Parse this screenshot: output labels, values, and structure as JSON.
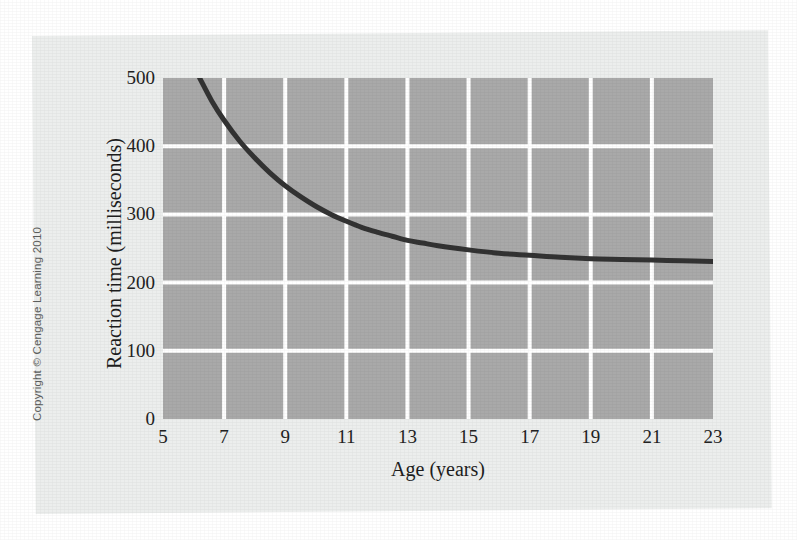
{
  "figure": {
    "copyright": "Copyright © Cengage Learning 2010"
  },
  "chart_data": {
    "type": "line",
    "title": "",
    "xlabel": "Age (years)",
    "ylabel": "Reaction time (milliseconds)",
    "xlim": [
      5,
      23
    ],
    "ylim": [
      0,
      500
    ],
    "xticks": [
      "5",
      "7",
      "9",
      "11",
      "13",
      "15",
      "17",
      "19",
      "21",
      "23"
    ],
    "xtick_values": [
      5,
      7,
      9,
      11,
      13,
      15,
      17,
      19,
      21,
      23
    ],
    "yticks": [
      "0",
      "100",
      "200",
      "300",
      "400",
      "500"
    ],
    "ytick_values": [
      0,
      100,
      200,
      300,
      400,
      500
    ],
    "grid": true,
    "grid_color": "#ffffff",
    "plot_background": "#a9a9a9",
    "legend": null,
    "series": [
      {
        "name": "Reaction time",
        "color": "#333333",
        "line_width": 5,
        "x": [
          6.2,
          6.6,
          7.0,
          7.5,
          8.0,
          8.5,
          9.0,
          9.5,
          10.0,
          10.5,
          11.0,
          11.5,
          12.0,
          12.5,
          13.0,
          13.5,
          14.0,
          15.0,
          16.0,
          17.0,
          18.0,
          19.0,
          20.0,
          21.0,
          22.0,
          23.0
        ],
        "y": [
          500,
          466,
          438,
          408,
          383,
          361,
          342,
          326,
          312,
          300,
          290,
          281,
          274,
          268,
          262,
          258,
          254,
          248,
          243,
          240,
          237,
          235,
          234,
          233,
          232,
          231
        ]
      }
    ],
    "annotations": []
  },
  "colors": {
    "page_background": "#ffffff",
    "panel_background": "#eceeed",
    "curve": "#333333",
    "gridline": "#ffffff",
    "tick_text": "#222222"
  }
}
